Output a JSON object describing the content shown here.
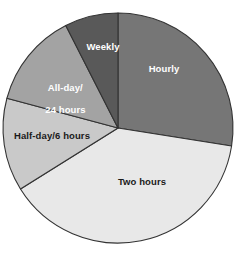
{
  "chart_data": {
    "type": "pie",
    "title": "",
    "subtitle": "",
    "xlabel": "",
    "ylabel": "",
    "legend_position": "none",
    "grid": false,
    "units": "percent",
    "categories": [
      "Hourly",
      "Two hours",
      "Half-day/6 hours",
      "All-day/\n24 hours",
      "Weekly"
    ],
    "values": [
      27.5,
      38.5,
      13.0,
      13.5,
      7.5
    ],
    "start_angle_deg": 0,
    "direction": "clockwise",
    "slices": [
      {
        "label": "Hourly",
        "value": 27.5,
        "color": "#767676",
        "start_deg": 0,
        "end_deg": 99,
        "label_color": "#ffffff"
      },
      {
        "label": "Two hours",
        "value": 38.5,
        "color": "#e8e8e8",
        "start_deg": 99,
        "end_deg": 238,
        "label_color": "#1a1a1a"
      },
      {
        "label": "Half-day/6 hours",
        "value": 13.0,
        "color": "#c9c9c9",
        "start_deg": 238,
        "end_deg": 285,
        "label_color": "#1a1a1a"
      },
      {
        "label": "All-day/\n24 hours",
        "value": 13.5,
        "color": "#a3a3a3",
        "start_deg": 285,
        "end_deg": 333,
        "label_color": "#ffffff"
      },
      {
        "label": "Weekly",
        "value": 7.5,
        "color": "#595959",
        "start_deg": 333,
        "end_deg": 360,
        "label_color": "#ffffff"
      }
    ],
    "geometry": {
      "center_x": 118,
      "center_y": 128,
      "radius": 115
    },
    "stroke_color": "#333333",
    "background_color": "#ffffff"
  },
  "labels": {
    "hourly": "Hourly",
    "two_hours": "Two hours",
    "half_day": "Half-day/6 hours",
    "all_day_line1": "All-day/",
    "all_day_line2": "24 hours",
    "weekly": "Weekly"
  }
}
